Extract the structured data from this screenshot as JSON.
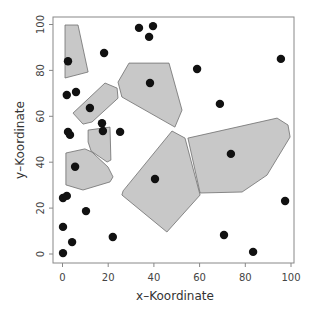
{
  "chart_data": {
    "type": "scatter",
    "title": "",
    "xlabel": "x–Koordinate",
    "ylabel": "y–Koordinate",
    "xlim": [
      -3.5,
      102
    ],
    "ylim": [
      -4,
      103
    ],
    "grid": false,
    "legend": null,
    "xticks": [
      0,
      20,
      40,
      60,
      80,
      100
    ],
    "yticks": [
      0,
      20,
      40,
      60,
      80,
      100
    ],
    "xtick_labels": [
      "0",
      "20",
      "40",
      "60",
      "80",
      "100"
    ],
    "ytick_labels": [
      "0",
      "20",
      "40",
      "60",
      "80",
      "100"
    ],
    "colors": {
      "polygon_fill": "#c8c8c8",
      "polygon_stroke": "#6e6e6e",
      "point": "#111111",
      "axis": "#888888"
    },
    "points": [
      {
        "x": 2.4,
        "y": 84.0
      },
      {
        "x": 18.2,
        "y": 87.6
      },
      {
        "x": 33.5,
        "y": 98.5
      },
      {
        "x": 39.6,
        "y": 99.3
      },
      {
        "x": 37.9,
        "y": 94.6
      },
      {
        "x": 1.9,
        "y": 69.3
      },
      {
        "x": 5.9,
        "y": 70.6
      },
      {
        "x": 12.0,
        "y": 63.6
      },
      {
        "x": 17.3,
        "y": 57.0
      },
      {
        "x": 17.7,
        "y": 53.6
      },
      {
        "x": 25.2,
        "y": 53.2
      },
      {
        "x": 2.4,
        "y": 53.2
      },
      {
        "x": 3.3,
        "y": 51.9
      },
      {
        "x": 38.3,
        "y": 74.5
      },
      {
        "x": 58.9,
        "y": 80.6
      },
      {
        "x": 95.6,
        "y": 85.0
      },
      {
        "x": 68.9,
        "y": 65.4
      },
      {
        "x": 5.5,
        "y": 38.0
      },
      {
        "x": 40.5,
        "y": 32.7
      },
      {
        "x": 0.2,
        "y": 24.4
      },
      {
        "x": 1.9,
        "y": 25.3
      },
      {
        "x": 10.3,
        "y": 18.7
      },
      {
        "x": 0.2,
        "y": 11.8
      },
      {
        "x": 4.2,
        "y": 5.2
      },
      {
        "x": 22.0,
        "y": 7.4
      },
      {
        "x": 0.2,
        "y": 0.4
      },
      {
        "x": 73.7,
        "y": 43.6
      },
      {
        "x": 97.4,
        "y": 23.1
      },
      {
        "x": 70.7,
        "y": 8.3
      },
      {
        "x": 83.4,
        "y": 0.9
      }
    ],
    "polygons": [
      {
        "name": "cell-top-left",
        "vertices": [
          [
            1.1,
            99.8
          ],
          [
            6.8,
            99.8
          ],
          [
            11.2,
            79.3
          ],
          [
            1.1,
            76.7
          ]
        ]
      },
      {
        "name": "cell-top-center",
        "vertices": [
          [
            29.1,
            83.2
          ],
          [
            46.6,
            83.2
          ],
          [
            52.3,
            62.7
          ],
          [
            49.2,
            55.3
          ],
          [
            26.0,
            68.4
          ],
          [
            24.3,
            74.9
          ]
        ]
      },
      {
        "name": "cell-diagonal",
        "vertices": [
          [
            4.6,
            61.4
          ],
          [
            18.6,
            74.5
          ],
          [
            23.9,
            72.3
          ],
          [
            24.3,
            67.9
          ],
          [
            12.9,
            57.5
          ],
          [
            8.97,
            56.6
          ]
        ]
      },
      {
        "name": "cell-small-vertical",
        "vertices": [
          [
            11.2,
            54.0
          ],
          [
            20.8,
            55.3
          ],
          [
            21.2,
            40.9
          ],
          [
            19.5,
            40.1
          ],
          [
            12.5,
            44.9
          ],
          [
            11.2,
            48.8
          ]
        ]
      },
      {
        "name": "cell-lower-left",
        "vertices": [
          [
            1.5,
            44.0
          ],
          [
            9.8,
            45.8
          ],
          [
            12.9,
            44.4
          ],
          [
            19.9,
            37.9
          ],
          [
            22.1,
            33.6
          ],
          [
            20.8,
            31.4
          ],
          [
            8.97,
            27.9
          ],
          [
            1.5,
            30.1
          ]
        ]
      },
      {
        "name": "cell-center-diamond",
        "vertices": [
          [
            47.9,
            53.6
          ],
          [
            53.6,
            50.5
          ],
          [
            60.2,
            25.7
          ],
          [
            45.7,
            9.6
          ],
          [
            26.0,
            25.7
          ],
          [
            26.5,
            27.5
          ]
        ]
      },
      {
        "name": "cell-right",
        "vertices": [
          [
            54.9,
            50.5
          ],
          [
            93.9,
            59.2
          ],
          [
            98.7,
            56.2
          ],
          [
            99.6,
            51.0
          ],
          [
            89.5,
            34.4
          ],
          [
            78.6,
            27.0
          ],
          [
            60.2,
            26.6
          ]
        ]
      }
    ]
  }
}
